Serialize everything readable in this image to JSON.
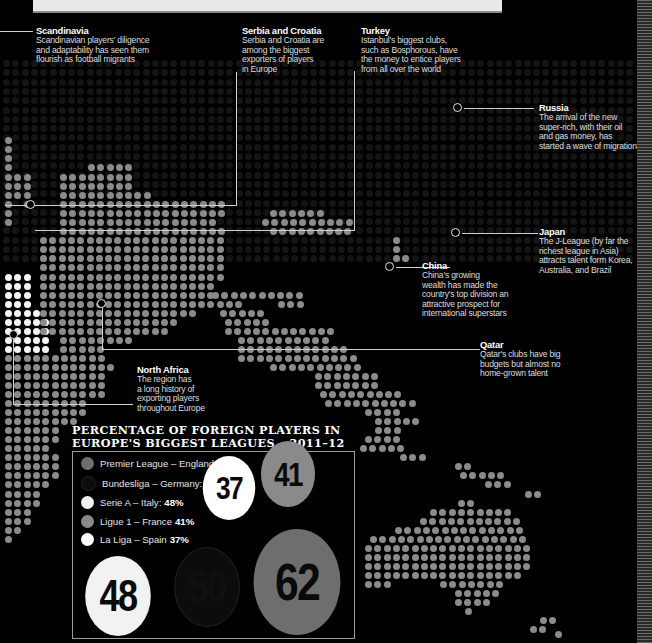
{
  "callouts": [
    {
      "id": "scandinavia",
      "title": "Scandinavia",
      "lines": [
        "Scandinavian players' diligence",
        "and adaptability has seen them",
        "flourish as football migrants"
      ]
    },
    {
      "id": "serbia-croatia",
      "title": "Serbia and Croatia",
      "lines": [
        "Serbia and Croatia are",
        "among the biggest",
        "exporters of players",
        "in Europe"
      ]
    },
    {
      "id": "turkey",
      "title": "Turkey",
      "lines": [
        "Istanbul's biggest clubs,",
        "such as Bosphorous, have",
        "the money to entice players",
        "from all over the world"
      ]
    },
    {
      "id": "russia",
      "title": "Russia",
      "lines": [
        "The arrival of the new",
        "super-rich, with their oil",
        "and gas money, has",
        "started a wave of migration"
      ]
    },
    {
      "id": "japan",
      "title": "Japan",
      "lines": [
        "The J-League (by far the",
        "richest league in Asia)",
        "attracts talent form Korea,",
        "Australia, and Brazil"
      ]
    },
    {
      "id": "china",
      "title": "China",
      "lines": [
        "China's growing",
        "wealth has made the",
        "country's top division an",
        "attractive prospect for",
        "international superstars"
      ]
    },
    {
      "id": "qatar",
      "title": "Qatar",
      "lines": [
        "Qatar's clubs have big",
        "budgets but almost no",
        "home-grown talent"
      ]
    },
    {
      "id": "north-africa",
      "title": "North Africa",
      "lines": [
        "The region has",
        "a long history of",
        "exporting players",
        "throughout Europe"
      ]
    }
  ],
  "chart_data": {
    "type": "bubble",
    "title": "PERCENTAGE OF FOREIGN PLAYERS IN EUROPE'S BIGGEST LEAGUES – 2011–12",
    "title_lines": [
      "PERCENTAGE OF FOREIGN PLAYERS IN",
      "EUROPE'S BIGGEST LEAGUES – 2011–12"
    ],
    "unit": "%",
    "series": [
      {
        "name": "Premier League – England",
        "label": "Premier League – England:",
        "value": 62,
        "value_label": "62%",
        "color": "#6e6e6e"
      },
      {
        "name": "Bundesliga – Germany",
        "label": "Bundesliga – Germany:",
        "value": 50,
        "value_label": "50%",
        "color": "#0c0c0c"
      },
      {
        "name": "Serie A – Italy",
        "label": "Serie A – Italy:",
        "value": 48,
        "value_label": "48%",
        "color": "#f2f2f2"
      },
      {
        "name": "Ligue 1 – France",
        "label": "Ligue 1 – France",
        "value": 41,
        "value_label": "41%",
        "color": "#8a8a8a"
      },
      {
        "name": "La Liga – Spain",
        "label": "La Liga – Spain",
        "value": 37,
        "value_label": "37%",
        "color": "#ffffff"
      }
    ],
    "bubbles": [
      {
        "value": "62",
        "color": "#6e6e6e"
      },
      {
        "value": "50",
        "color": "#0c0c0c"
      },
      {
        "value": "48",
        "color": "#f2f2f2"
      },
      {
        "value": "41",
        "color": "#8a8a8a"
      },
      {
        "value": "37",
        "color": "#ffffff"
      }
    ]
  },
  "colors": {
    "background": "#000000",
    "land_dot": "#8b8b8b",
    "highlight_dot": "#f4f4f4",
    "faint_dot": "#141414"
  },
  "map_rows": [
    [
      137,
      5,
      5,
      "g"
    ],
    [
      146,
      5,
      5,
      "g"
    ],
    [
      155,
      5,
      14,
      "g"
    ],
    [
      164,
      5,
      14,
      "g"
    ],
    [
      164,
      88,
      126,
      "g"
    ],
    [
      174,
      5,
      24,
      "g"
    ],
    [
      174,
      60,
      126,
      "g"
    ],
    [
      183,
      5,
      24,
      "g"
    ],
    [
      183,
      60,
      126,
      "g"
    ],
    [
      192,
      5,
      24,
      "g"
    ],
    [
      192,
      60,
      145,
      "g"
    ],
    [
      201,
      5,
      5,
      "g"
    ],
    [
      201,
      24,
      24,
      "g"
    ],
    [
      201,
      60,
      220,
      "g"
    ],
    [
      210,
      5,
      5,
      "g"
    ],
    [
      210,
      60,
      220,
      "g"
    ],
    [
      210,
      270,
      325,
      "g"
    ],
    [
      219,
      5,
      5,
      "g"
    ],
    [
      219,
      60,
      215,
      "g"
    ],
    [
      219,
      262,
      346,
      "g"
    ],
    [
      228,
      60,
      220,
      "g"
    ],
    [
      228,
      270,
      346,
      "g"
    ],
    [
      237,
      40,
      220,
      "g"
    ],
    [
      237,
      393,
      402,
      "g"
    ],
    [
      246,
      40,
      220,
      "g"
    ],
    [
      246,
      393,
      402,
      "g"
    ],
    [
      255,
      40,
      220,
      "g"
    ],
    [
      255,
      393,
      402,
      "g"
    ],
    [
      255,
      402,
      411,
      "g"
    ],
    [
      264,
      40,
      220,
      "g"
    ],
    [
      274,
      5,
      30,
      "w"
    ],
    [
      274,
      40,
      220,
      "g"
    ],
    [
      283,
      5,
      24,
      "w"
    ],
    [
      283,
      40,
      210,
      "g"
    ],
    [
      292,
      5,
      30,
      "w"
    ],
    [
      292,
      40,
      210,
      "g"
    ],
    [
      292,
      212,
      300,
      "g"
    ],
    [
      301,
      5,
      30,
      "w"
    ],
    [
      301,
      40,
      240,
      "g"
    ],
    [
      301,
      278,
      300,
      "g"
    ],
    [
      310,
      5,
      40,
      "w"
    ],
    [
      310,
      40,
      190,
      "g"
    ],
    [
      310,
      220,
      265,
      "g"
    ],
    [
      319,
      5,
      50,
      "w"
    ],
    [
      319,
      40,
      175,
      "g"
    ],
    [
      319,
      225,
      268,
      "g"
    ],
    [
      328,
      5,
      50,
      "w"
    ],
    [
      328,
      40,
      170,
      "g"
    ],
    [
      328,
      225,
      330,
      "g"
    ],
    [
      337,
      5,
      50,
      "w"
    ],
    [
      337,
      60,
      130,
      "g"
    ],
    [
      337,
      238,
      330,
      "g"
    ],
    [
      346,
      5,
      50,
      "w"
    ],
    [
      346,
      60,
      100,
      "g"
    ],
    [
      346,
      238,
      345,
      "g"
    ],
    [
      355,
      5,
      100,
      "g"
    ],
    [
      355,
      238,
      350,
      "g"
    ],
    [
      364,
      5,
      110,
      "g"
    ],
    [
      364,
      270,
      360,
      "g"
    ],
    [
      373,
      5,
      100,
      "g"
    ],
    [
      373,
      315,
      375,
      "g"
    ],
    [
      382,
      5,
      100,
      "g"
    ],
    [
      382,
      315,
      380,
      "g"
    ],
    [
      391,
      5,
      100,
      "g"
    ],
    [
      391,
      320,
      395,
      "g"
    ],
    [
      400,
      5,
      80,
      "g"
    ],
    [
      400,
      325,
      410,
      "g"
    ],
    [
      409,
      5,
      80,
      "g"
    ],
    [
      409,
      365,
      400,
      "g"
    ],
    [
      418,
      5,
      70,
      "g"
    ],
    [
      418,
      375,
      415,
      "g"
    ],
    [
      427,
      5,
      60,
      "g"
    ],
    [
      427,
      375,
      398,
      "g"
    ],
    [
      436,
      5,
      60,
      "g"
    ],
    [
      436,
      365,
      400,
      "g"
    ],
    [
      445,
      5,
      50,
      "g"
    ],
    [
      445,
      360,
      400,
      "g"
    ],
    [
      454,
      5,
      55,
      "g"
    ],
    [
      454,
      400,
      420,
      "g"
    ],
    [
      463,
      5,
      55,
      "g"
    ],
    [
      463,
      455,
      470,
      "g"
    ],
    [
      472,
      5,
      55,
      "g"
    ],
    [
      472,
      460,
      500,
      "g"
    ],
    [
      481,
      5,
      45,
      "g"
    ],
    [
      481,
      485,
      510,
      "g"
    ],
    [
      491,
      5,
      35,
      "g"
    ],
    [
      491,
      525,
      540,
      "g"
    ],
    [
      500,
      5,
      35,
      "g"
    ],
    [
      500,
      458,
      470,
      "g"
    ],
    [
      509,
      5,
      25,
      "g"
    ],
    [
      509,
      430,
      505,
      "g"
    ],
    [
      518,
      5,
      25,
      "g"
    ],
    [
      518,
      420,
      520,
      "g"
    ],
    [
      527,
      5,
      15,
      "g"
    ],
    [
      527,
      395,
      520,
      "g"
    ],
    [
      536,
      5,
      5,
      "g"
    ],
    [
      536,
      370,
      525,
      "g"
    ],
    [
      545,
      365,
      525,
      "g"
    ],
    [
      554,
      365,
      525,
      "g"
    ],
    [
      563,
      365,
      525,
      "g"
    ],
    [
      572,
      365,
      520,
      "g"
    ],
    [
      581,
      365,
      385,
      "g"
    ],
    [
      581,
      440,
      505,
      "g"
    ],
    [
      590,
      455,
      495,
      "g"
    ],
    [
      599,
      455,
      490,
      "g"
    ],
    [
      608,
      465,
      465,
      "g"
    ],
    [
      617,
      540,
      555,
      "g"
    ],
    [
      626,
      530,
      540,
      "g"
    ],
    [
      631,
      555,
      560,
      "g"
    ]
  ],
  "faint_region": {
    "x0": 0,
    "x1": 640,
    "y0": 60,
    "y1": 260
  },
  "leaders": [
    {
      "x": 0,
      "y": 31,
      "w": 33,
      "h": 1
    },
    {
      "x": 236,
      "y": 72,
      "w": 1,
      "h": 134
    },
    {
      "x": 5,
      "y": 205,
      "w": 232,
      "h": 1
    },
    {
      "x": 354,
      "y": 71,
      "w": 1,
      "h": 160
    },
    {
      "x": 35,
      "y": 230,
      "w": 320,
      "h": 1
    },
    {
      "x": 464,
      "y": 108,
      "w": 70,
      "h": 1
    },
    {
      "x": 462,
      "y": 233,
      "w": 76,
      "h": 1
    },
    {
      "x": 396,
      "y": 267,
      "w": 54,
      "h": 1
    },
    {
      "x": 102,
      "y": 304,
      "w": 1,
      "h": 45
    },
    {
      "x": 102,
      "y": 349,
      "w": 378,
      "h": 1
    },
    {
      "x": 13,
      "y": 334,
      "w": 1,
      "h": 70
    },
    {
      "x": 13,
      "y": 404,
      "w": 120,
      "h": 1
    }
  ],
  "rings": [
    {
      "x": 453,
      "y": 103
    },
    {
      "x": 451,
      "y": 228
    },
    {
      "x": 385,
      "y": 262
    },
    {
      "x": 26,
      "y": 200
    },
    {
      "x": 97,
      "y": 299
    },
    {
      "x": 9,
      "y": 330
    }
  ]
}
